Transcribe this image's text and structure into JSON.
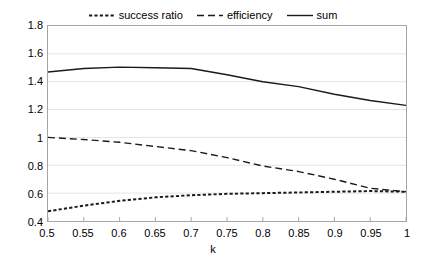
{
  "chart_data": {
    "type": "line",
    "title": "",
    "xlabel": "k",
    "ylabel": "",
    "xlim": [
      0.5,
      1.0
    ],
    "ylim": [
      0.4,
      1.8
    ],
    "grid": true,
    "legend_position": "top",
    "x": [
      0.5,
      0.55,
      0.6,
      0.65,
      0.7,
      0.75,
      0.8,
      0.85,
      0.9,
      0.95,
      1.0
    ],
    "xtick_labels": [
      "0.5",
      "0.55",
      "0.6",
      "0.65",
      "0.7",
      "0.75",
      "0.8",
      "0.85",
      "0.9",
      "0.95",
      "1"
    ],
    "ytick_values": [
      0.4,
      0.6,
      0.8,
      1.0,
      1.2,
      1.4,
      1.6,
      1.8
    ],
    "ytick_labels": [
      "0.4",
      "0.6",
      "0.8",
      "1",
      "1.2",
      "1.4",
      "1.6",
      "1.8"
    ],
    "series": [
      {
        "name": "success ratio",
        "style": "dotted",
        "color": "#1a1a1a",
        "values": [
          0.47,
          0.51,
          0.545,
          0.57,
          0.585,
          0.595,
          0.6,
          0.605,
          0.61,
          0.615,
          0.61
        ]
      },
      {
        "name": "efficiency",
        "style": "dashed",
        "color": "#1a1a1a",
        "values": [
          1.0,
          0.985,
          0.965,
          0.935,
          0.905,
          0.855,
          0.795,
          0.755,
          0.7,
          0.635,
          0.61
        ]
      },
      {
        "name": "sum",
        "style": "solid",
        "color": "#1a1a1a",
        "values": [
          1.47,
          1.495,
          1.505,
          1.5,
          1.495,
          1.45,
          1.4,
          1.365,
          1.31,
          1.265,
          1.23
        ]
      }
    ]
  },
  "axis": {
    "x_title": "k"
  },
  "colors": {
    "line": "#1a1a1a",
    "grid": "#e4e4e4",
    "frame": "#a6a6a6",
    "background": "#ffffff"
  }
}
